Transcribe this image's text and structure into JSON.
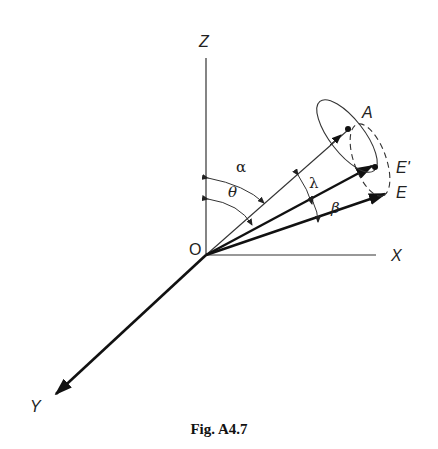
{
  "figure": {
    "caption": "Fig. A4.7",
    "type": "3D vector geometry diagram"
  },
  "axes": {
    "z_label": "Z",
    "x_label": "X",
    "y_label": "Y",
    "origin_label": "O"
  },
  "points": {
    "a_label": "A",
    "e_prime_label": "E'",
    "e_label": "E"
  },
  "angles": {
    "alpha": "α",
    "theta": "θ",
    "lambda": "λ",
    "beta": "β"
  },
  "colors": {
    "line": "#222222",
    "background": "#ffffff"
  }
}
